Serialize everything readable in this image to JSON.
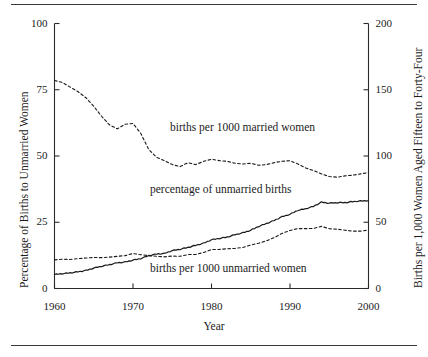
{
  "chart_data": {
    "type": "line",
    "title": "",
    "xlabel": "Year",
    "ylabel": "Percentage of Births to Unmarried Women",
    "ylabel_right": "Births per 1,000 Women Aged Fifteen to Forty-Four",
    "xlim": [
      1960,
      2000
    ],
    "ylim": [
      0,
      100
    ],
    "ylim_right": [
      0,
      200
    ],
    "xticks": [
      1960,
      1970,
      1980,
      1990,
      2000
    ],
    "xticklabels": [
      "1960",
      "1970",
      "1980",
      "1990",
      "2000"
    ],
    "yticks": [
      0,
      25,
      50,
      75,
      100
    ],
    "yticklabels": [
      "0",
      "25",
      "50",
      "75",
      "100"
    ],
    "yticks_right": [
      0,
      50,
      100,
      150,
      200
    ],
    "yticklabels_right": [
      "0",
      "50",
      "100",
      "150",
      "200"
    ],
    "grid": false,
    "legend": "inline-annotations",
    "x": [
      1960,
      1961,
      1962,
      1963,
      1964,
      1965,
      1966,
      1967,
      1968,
      1969,
      1970,
      1971,
      1972,
      1973,
      1974,
      1975,
      1976,
      1977,
      1978,
      1979,
      1980,
      1981,
      1982,
      1983,
      1984,
      1985,
      1986,
      1987,
      1988,
      1989,
      1990,
      1991,
      1992,
      1993,
      1994,
      1995,
      1996,
      1997,
      1998,
      1999,
      2000
    ],
    "series": [
      {
        "name": "births per 1000 married women",
        "axis": "right",
        "style": "dashed",
        "unit": "births per 1,000 married women aged 15-44",
        "values": [
          157.0,
          155.5,
          152.0,
          148.5,
          144.0,
          137.5,
          130.0,
          123.5,
          120.5,
          124.0,
          124.5,
          117.0,
          105.0,
          99.0,
          96.5,
          93.5,
          92.0,
          95.0,
          93.5,
          96.0,
          97.5,
          96.5,
          96.0,
          94.5,
          94.0,
          94.5,
          93.0,
          93.5,
          95.0,
          96.0,
          96.5,
          94.0,
          91.0,
          89.0,
          86.5,
          84.5,
          84.0,
          85.0,
          85.5,
          86.5,
          87.5
        ]
      },
      {
        "name": "percentage of unmarried births",
        "axis": "left",
        "style": "solid",
        "unit": "percent of all births to unmarried women",
        "values": [
          5.3,
          5.6,
          5.9,
          6.3,
          6.8,
          7.7,
          8.4,
          9.0,
          9.7,
          10.0,
          10.7,
          11.3,
          12.4,
          13.0,
          13.2,
          14.3,
          14.8,
          15.5,
          16.3,
          17.1,
          18.4,
          18.9,
          19.4,
          20.3,
          21.0,
          22.0,
          23.4,
          24.5,
          25.7,
          27.1,
          28.0,
          29.5,
          30.1,
          31.0,
          32.6,
          32.2,
          32.4,
          32.4,
          32.8,
          33.0,
          33.2
        ]
      },
      {
        "name": "births per 1000 unmarried women",
        "axis": "right",
        "style": "dashed",
        "unit": "births per 1,000 unmarried women aged 15-44",
        "values": [
          21.6,
          22.1,
          21.9,
          22.5,
          23.0,
          23.4,
          23.3,
          23.7,
          24.3,
          24.8,
          26.4,
          25.5,
          24.8,
          24.3,
          23.9,
          24.5,
          24.3,
          25.6,
          25.7,
          27.2,
          29.4,
          29.5,
          30.0,
          30.3,
          31.0,
          32.8,
          34.2,
          36.0,
          38.5,
          41.6,
          43.8,
          45.2,
          45.2,
          45.3,
          46.9,
          45.1,
          44.8,
          44.0,
          43.3,
          43.3,
          44.1
        ]
      }
    ],
    "annotations": [
      {
        "text": "births per 1000 married women",
        "x_px": 170,
        "y_px": 121
      },
      {
        "text": "percentage of unmarried births",
        "x_px": 150,
        "y_px": 183
      },
      {
        "text": "births per 1000 unmarried women",
        "x_px": 150,
        "y_px": 262
      }
    ],
    "colors": {
      "line": "#1a1a1a",
      "axis": "#2b2b2b",
      "background": "#ffffff"
    }
  }
}
